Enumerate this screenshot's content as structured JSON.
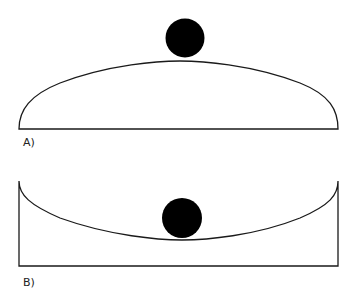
{
  "panels": [
    {
      "label": "A)",
      "description": "Ball resting on top of a convex dome (unstable equilibrium)"
    },
    {
      "label": "B)",
      "description": "Ball resting at bottom of a concave bowl (stable equilibrium)"
    }
  ],
  "colors": {
    "stroke": "#1a1a1a",
    "ball": "#000000",
    "background": "#ffffff"
  }
}
